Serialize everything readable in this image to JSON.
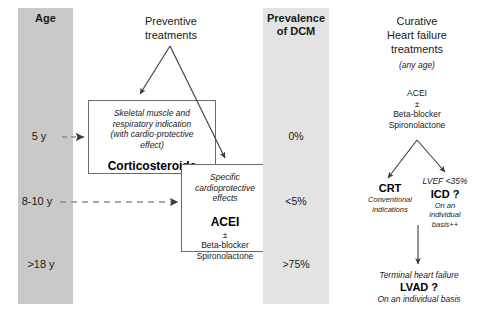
{
  "figure": {
    "columns": {
      "age": {
        "header": "Age",
        "labels": [
          "5 y",
          "8-10 y",
          ">18 y"
        ]
      },
      "preventive": {
        "header_line1": "Preventive",
        "header_line2": "treatments"
      },
      "prevalence": {
        "header_line1": "Prevalence",
        "header_line2": "of DCM",
        "values": [
          "0%",
          "<5%",
          ">75%"
        ]
      },
      "curative": {
        "header_line1": "Curative",
        "header_line2": "Heart failure",
        "header_line3": "treatments",
        "header_note": "(any age)"
      }
    },
    "boxes": {
      "corticosteroids": {
        "indication_line1": "Skeletal muscle and",
        "indication_line2": "respiratory indication",
        "indication_line3": "(with cardio-protective",
        "indication_line4": "effect)",
        "drug": "Corticosteroids"
      },
      "cardioprotective": {
        "indication_line1": "Specific",
        "indication_line2": "cardioprotective",
        "indication_line3": "effects",
        "drug": "ACEI",
        "plus_minus": "±",
        "adjunct_line1": "Beta-blocker",
        "adjunct_line2": "Spironolactone"
      }
    },
    "curative_flow": {
      "first_line": {
        "drug": "ACEI",
        "plus_minus": "±",
        "adjunct_line1": "Beta-blocker",
        "adjunct_line2": "Spironolactone"
      },
      "branch_left": {
        "title": "CRT",
        "note_line1": "Conventional",
        "note_line2": "indications"
      },
      "branch_right": {
        "criterion": "LVEF <35%",
        "title": "ICD ?",
        "note_line1": "On an",
        "note_line2": "individual",
        "note_line3": "basis++"
      },
      "terminal": {
        "stage": "Terminal heart failure",
        "title": "LVAD ?",
        "note": "On an individual basis"
      }
    },
    "colors": {
      "band_dark": "#c9c9c9",
      "band_light": "#e3e3e3",
      "box_border": "#6a6a6a",
      "arrow": "#3a3a3a",
      "text": "#1a1a1a"
    }
  }
}
